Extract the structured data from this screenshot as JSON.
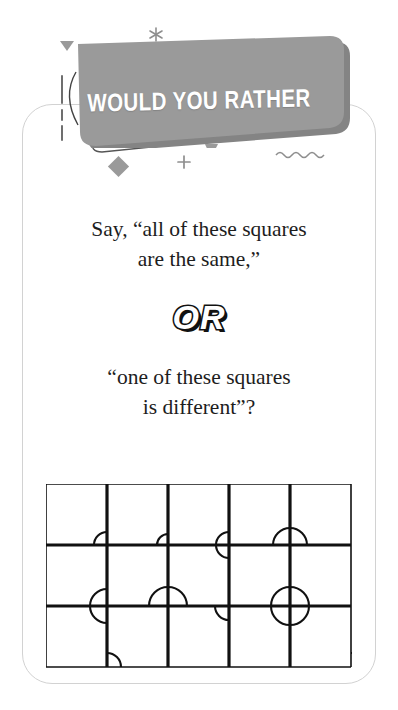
{
  "header": {
    "banner_label": "WOULD YOU RATHER",
    "banner_color": "#9a9a9a",
    "banner_shadow_color": "#848484",
    "banner_text_color": "#ffffff"
  },
  "card": {
    "border_color": "#d2d2d2",
    "background": "#ffffff"
  },
  "prompt": {
    "option_a_line1": "Say, “all of these squares",
    "option_a_line2": "are the same,”",
    "divider_label": "OR",
    "option_b_line1": "“one of these squares",
    "option_b_line2": "is different”?",
    "text_color": "#1d1d1d"
  },
  "illusion": {
    "name": "coffer-illusion-grid",
    "columns": 5,
    "rows": 3,
    "line_color": "#111111",
    "cell_width": 61,
    "cell_height": 61,
    "arcs": [
      {
        "cx": 61,
        "cy": 61,
        "r": 13,
        "start": 180,
        "end": 270
      },
      {
        "cx": 122,
        "cy": 61,
        "r": 11,
        "start": 180,
        "end": 270
      },
      {
        "cx": 183,
        "cy": 61,
        "r": 13,
        "start": 180,
        "end": 270
      },
      {
        "cx": 183,
        "cy": 61,
        "r": 13,
        "start": 90,
        "end": 180
      },
      {
        "cx": 244,
        "cy": 61,
        "r": 17,
        "start": 180,
        "end": 360
      },
      {
        "cx": 61,
        "cy": 122,
        "r": 17,
        "start": 90,
        "end": 270
      },
      {
        "cx": 122,
        "cy": 122,
        "r": 19,
        "start": 180,
        "end": 360
      },
      {
        "cx": 183,
        "cy": 122,
        "r": 14,
        "start": 90,
        "end": 180
      },
      {
        "cx": 244,
        "cy": 122,
        "r": 19,
        "start": 0,
        "end": 360
      },
      {
        "cx": 61,
        "cy": 183,
        "r": 14,
        "start": 270,
        "end": 360
      },
      {
        "cx": 305,
        "cy": 183,
        "r": 14,
        "start": 270,
        "end": 360
      }
    ]
  },
  "decorations": {
    "asterisk": "asterisk-sparkle",
    "triangle_sm": "small-triangle",
    "circle_dot": "filled-circle-dot",
    "diamond": "diamond-shape",
    "plus": "plus-sign",
    "squiggle": "wavy-line",
    "zigzag": "zigzag-line",
    "dashes": "dashed-strokes",
    "color": "#9a9a9a"
  }
}
